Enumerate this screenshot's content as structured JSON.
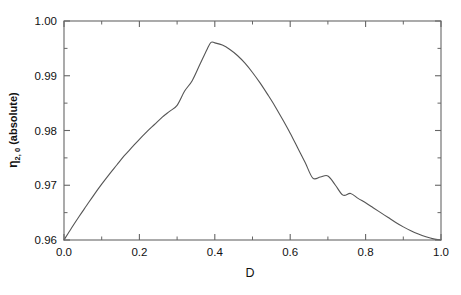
{
  "chart_data": {
    "type": "line",
    "title": "",
    "subtitle": "",
    "xlabel": "D",
    "ylabel": "η",
    "ylabel_sub": "2, 0",
    "ylabel_suffix": " (absolute)",
    "ylabel_full": "η 2, 0 (absolute)",
    "xlim": [
      0.0,
      1.0
    ],
    "ylim": [
      0.96,
      1.0
    ],
    "xticks": [
      "0.0",
      "0.2",
      "0.4",
      "0.6",
      "0.8",
      "1.0"
    ],
    "xtick_values": [
      0.0,
      0.2,
      0.4,
      0.6,
      0.8,
      1.0
    ],
    "xminor_values": [
      0.1,
      0.3,
      0.5,
      0.7,
      0.9
    ],
    "yticks": [
      "0.96",
      "0.97",
      "0.98",
      "0.99",
      "1.00"
    ],
    "ytick_values": [
      0.96,
      0.97,
      0.98,
      0.99,
      1.0
    ],
    "yminor_values": [
      0.965,
      0.975,
      0.985,
      0.995
    ],
    "grid": false,
    "legend": null,
    "line_color": "#555555",
    "frame_color": "#666666",
    "background": "#ffffff",
    "series": [
      {
        "name": "eta_2_0_absolute",
        "x": [
          0.0,
          0.02,
          0.04,
          0.06,
          0.08,
          0.1,
          0.12,
          0.14,
          0.16,
          0.18,
          0.2,
          0.22,
          0.24,
          0.26,
          0.28,
          0.3,
          0.32,
          0.34,
          0.36,
          0.38,
          0.39,
          0.4,
          0.42,
          0.44,
          0.46,
          0.48,
          0.5,
          0.52,
          0.54,
          0.56,
          0.58,
          0.6,
          0.62,
          0.64,
          0.66,
          0.68,
          0.7,
          0.72,
          0.74,
          0.76,
          0.78,
          0.8,
          0.82,
          0.84,
          0.86,
          0.88,
          0.9,
          0.92,
          0.94,
          0.96,
          0.98,
          1.0
        ],
        "values": [
          0.96,
          0.9622,
          0.9643,
          0.9663,
          0.9683,
          0.9702,
          0.972,
          0.9737,
          0.9754,
          0.9769,
          0.9784,
          0.9798,
          0.9811,
          0.9824,
          0.9835,
          0.9846,
          0.9872,
          0.9891,
          0.992,
          0.9949,
          0.9961,
          0.996,
          0.9956,
          0.9948,
          0.9937,
          0.9923,
          0.9906,
          0.9887,
          0.9866,
          0.9844,
          0.982,
          0.9795,
          0.9768,
          0.9741,
          0.9713,
          0.9715,
          0.9717,
          0.97,
          0.9682,
          0.9685,
          0.9676,
          0.9668,
          0.9659,
          0.965,
          0.9641,
          0.9632,
          0.9624,
          0.9617,
          0.9611,
          0.9606,
          0.9602,
          0.96
        ],
        "peak_x": 0.39,
        "peak_y": 0.9961,
        "start_point": [
          0.0,
          0.96
        ],
        "end_point": [
          1.0,
          0.96
        ]
      }
    ]
  },
  "axes": {
    "xlabel": "D",
    "ylabel_glyph": "η",
    "ylabel_subscript": "2, 0",
    "ylabel_tail": "(absolute)"
  }
}
